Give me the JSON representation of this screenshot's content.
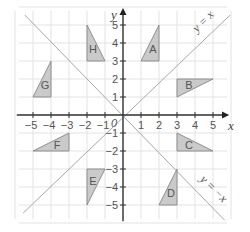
{
  "diagram": {
    "type": "coordinate-grid",
    "origin_px": [
      123,
      115
    ],
    "unit_px": 18,
    "x_range": [
      -5,
      5
    ],
    "y_range": [
      -5,
      5
    ],
    "axes": {
      "x_label": "x",
      "y_label": "y",
      "origin_label": "0",
      "x_ticks": [
        -5,
        -4,
        -3,
        -2,
        -1,
        1,
        2,
        3,
        4,
        5
      ],
      "y_ticks": [
        -5,
        -4,
        -3,
        -2,
        -1,
        1,
        2,
        3,
        4,
        5
      ]
    },
    "lines": [
      {
        "id": "line-y-eq-x",
        "label": "y = x",
        "equation": "y=x"
      },
      {
        "id": "line-y-eq-neg-x",
        "label": "y = −x",
        "equation": "y=-x"
      }
    ],
    "triangles": [
      {
        "label": "A",
        "vertices": [
          [
            1,
            3
          ],
          [
            2,
            3
          ],
          [
            2,
            5
          ]
        ]
      },
      {
        "label": "B",
        "vertices": [
          [
            3,
            1
          ],
          [
            3,
            2
          ],
          [
            5,
            2
          ]
        ]
      },
      {
        "label": "C",
        "vertices": [
          [
            3,
            -1
          ],
          [
            3,
            -2
          ],
          [
            5,
            -2
          ]
        ]
      },
      {
        "label": "D",
        "vertices": [
          [
            2,
            -5
          ],
          [
            3,
            -5
          ],
          [
            3,
            -3
          ]
        ]
      },
      {
        "label": "E",
        "vertices": [
          [
            -2,
            -3
          ],
          [
            -1,
            -3
          ],
          [
            -2,
            -5
          ]
        ]
      },
      {
        "label": "F",
        "vertices": [
          [
            -5,
            -2
          ],
          [
            -3,
            -2
          ],
          [
            -3,
            -1
          ]
        ]
      },
      {
        "label": "G",
        "vertices": [
          [
            -5,
            1
          ],
          [
            -4,
            1
          ],
          [
            -4,
            3
          ]
        ]
      },
      {
        "label": "H",
        "vertices": [
          [
            -2,
            5
          ],
          [
            -2,
            3
          ],
          [
            -1,
            3
          ]
        ]
      }
    ],
    "colors": {
      "triangle_fill": "#cacaca",
      "triangle_stroke": "#8e8e8e",
      "axis": "#333333",
      "grid": "#e3e3e3",
      "diagonal": "#a8a8a8"
    }
  }
}
